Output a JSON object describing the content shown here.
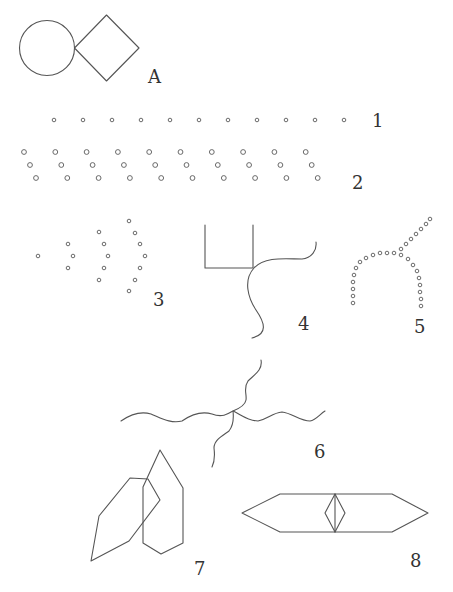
{
  "figure": {
    "type": "gestalt-grouping-illustration",
    "stroke_color": "#555555",
    "background": "#ffffff",
    "panels": [
      {
        "id": "A",
        "label": "A",
        "description": "circle tangent to a diamond (square rotated 45°)"
      },
      {
        "id": "1",
        "label": "1",
        "description": "single row of 11 evenly spaced small circles"
      },
      {
        "id": "2",
        "label": "2",
        "description": "10 diagonal triplets of small circles forming three staggered rows"
      },
      {
        "id": "3",
        "label": "3",
        "description": "concentric chevron/arc arrangement of dots: 1, 3, 5, 7 dots"
      },
      {
        "id": "4",
        "label": "4",
        "description": "U-shaped open rectangle with a wavy line crossing at its bottom-right corner"
      },
      {
        "id": "5",
        "label": "5",
        "description": "dotted arch (inverted U) crossed by a dotted diagonal line"
      },
      {
        "id": "6",
        "label": "6",
        "description": "horizontal wavy line crossed by a vertical wavy line"
      },
      {
        "id": "7",
        "label": "7",
        "description": "two overlapping hexagonal pencil-like polygons"
      },
      {
        "id": "8",
        "label": "8",
        "description": "elongated hexagon with a small diamond at its center"
      }
    ]
  },
  "labels": {
    "A": "A",
    "1": "1",
    "2": "2",
    "3": "3",
    "4": "4",
    "5": "5",
    "6": "6",
    "7": "7",
    "8": "8"
  },
  "row1": {
    "count": 11,
    "start_x": 54,
    "spacing": 29,
    "y": 120,
    "r": 1.8
  },
  "row2": {
    "count": 10,
    "start_x": 24,
    "spacing": 31.3,
    "y_top": 152,
    "dy": 13,
    "dx": 6,
    "r": 2.4
  },
  "pattern3": {
    "columns": [
      {
        "x": 38,
        "ys": [
          256
        ]
      },
      {
        "xs": [
          68,
          73,
          68
        ],
        "ys": [
          244,
          256,
          268
        ]
      },
      {
        "xs": [
          99,
          104,
          108,
          104,
          99
        ],
        "ys": [
          232,
          244,
          256,
          268,
          280
        ]
      },
      {
        "xs": [
          129,
          135,
          140,
          145,
          140,
          135,
          129
        ],
        "ys": [
          221,
          233,
          244,
          256,
          268,
          280,
          291
        ]
      }
    ],
    "r": 1.8
  }
}
